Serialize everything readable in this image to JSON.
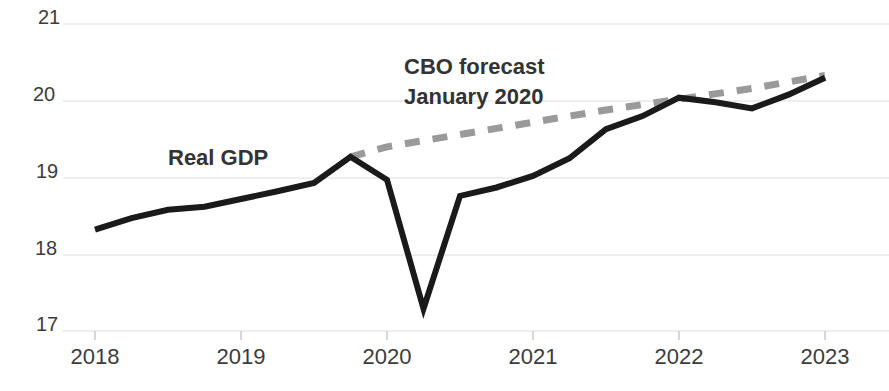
{
  "chart_data": {
    "type": "line",
    "title": "",
    "subtitle": "",
    "xlabel": "",
    "ylabel": "",
    "xlim": [
      2018.0,
      2023.0
    ],
    "ylim": [
      17,
      21
    ],
    "grid": true,
    "grid_axis": "y",
    "legend_position": "inline-annotations",
    "x_ticks": [
      "2018",
      "2019",
      "2020",
      "2021",
      "2022",
      "2023"
    ],
    "x_tick_values": [
      2018,
      2019,
      2020,
      2021,
      2022,
      2023
    ],
    "y_ticks": [
      "17",
      "18",
      "19",
      "20",
      "21"
    ],
    "y_tick_values": [
      17,
      18,
      19,
      20,
      21
    ],
    "series": [
      {
        "name": "Real GDP",
        "style": "solid",
        "color": "#1a1a1a",
        "width": 6,
        "x": [
          2018.0,
          2018.25,
          2018.5,
          2018.75,
          2019.0,
          2019.25,
          2019.5,
          2019.75,
          2020.0,
          2020.25,
          2020.5,
          2020.75,
          2021.0,
          2021.25,
          2021.5,
          2021.75,
          2022.0,
          2022.25,
          2022.5,
          2022.75,
          2023.0
        ],
        "values": [
          18.32,
          18.47,
          18.58,
          18.62,
          18.72,
          18.82,
          18.93,
          19.27,
          18.97,
          17.29,
          18.76,
          18.87,
          19.02,
          19.25,
          19.63,
          19.8,
          20.04,
          19.98,
          19.9,
          20.08,
          20.3
        ]
      },
      {
        "name": "CBO forecast January 2020",
        "style": "dashed",
        "color": "#9a9a9a",
        "width": 7,
        "x": [
          2019.75,
          2020.0,
          2020.5,
          2021.0,
          2021.5,
          2022.0,
          2022.5,
          2023.0
        ],
        "values": [
          19.27,
          19.4,
          19.56,
          19.72,
          19.88,
          20.02,
          20.16,
          20.33
        ]
      }
    ],
    "annotations": [
      {
        "text": "Real GDP",
        "x": 2018.5,
        "y": 19.15
      },
      {
        "text": "CBO forecast",
        "x": 2020.1,
        "y": 20.55
      },
      {
        "text": "January 2020",
        "x": 2020.1,
        "y": 20.15
      }
    ]
  },
  "axis": {
    "y_labels": [
      "21",
      "20",
      "19",
      "18",
      "17"
    ],
    "x_labels": [
      "2018",
      "2019",
      "2020",
      "2021",
      "2022",
      "2023"
    ]
  },
  "annotations": {
    "real_gdp": "Real GDP",
    "cbo_line1": "CBO forecast",
    "cbo_line2": "January 2020"
  },
  "colors": {
    "actual_line": "#1a1a1a",
    "forecast_line": "#9a9a9a",
    "grid": "#e8e8e8",
    "text": "#3c3c3c",
    "background": "#ffffff"
  }
}
